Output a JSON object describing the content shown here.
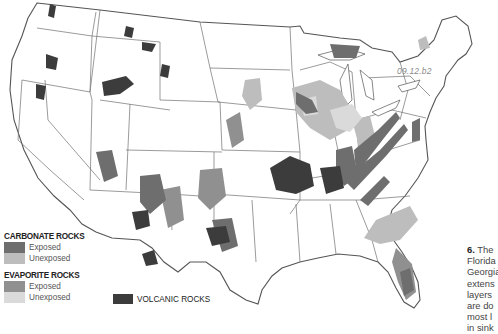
{
  "figure": {
    "code": "09.12.b2"
  },
  "legend": {
    "groups": [
      {
        "heading": "CARBONATE ROCKS",
        "items": [
          {
            "label": "Exposed",
            "color": "#6e6e6e"
          },
          {
            "label": "Unexposed",
            "color": "#bdbdbd"
          }
        ]
      },
      {
        "heading": "EVAPORITE ROCKS",
        "items": [
          {
            "label": "Exposed",
            "color": "#909090"
          },
          {
            "label": "Unexposed",
            "color": "#dadada"
          }
        ]
      }
    ],
    "volcanic": {
      "label": "VOLCANIC ROCKS",
      "color": "#3c3c3c"
    }
  },
  "caption": {
    "number": "6.",
    "lines": [
      "The",
      "Florida",
      "Georgia",
      "extens",
      "layers",
      "are do",
      "most l",
      "in sink"
    ]
  },
  "colors": {
    "background": "#ffffff",
    "border": "#6a6a6a",
    "carbonate_exposed": "#6e6e6e",
    "carbonate_unexposed": "#bdbdbd",
    "evaporite_exposed": "#909090",
    "evaporite_unexposed": "#dadada",
    "volcanic": "#3c3c3c"
  }
}
